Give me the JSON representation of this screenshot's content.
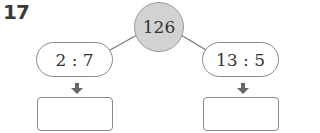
{
  "problem": {
    "number": "17"
  },
  "diagram": {
    "total": "126",
    "left": {
      "ratio": "2 : 7",
      "answer": ""
    },
    "right": {
      "ratio": "13 : 5",
      "answer": ""
    }
  },
  "colors": {
    "circle_fill": "#d2d2d2",
    "stroke": "#8a8a8a",
    "arrow": "#666666"
  }
}
